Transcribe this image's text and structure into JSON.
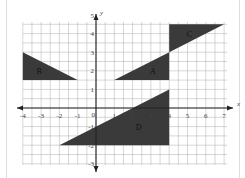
{
  "diagram": {
    "type": "coordinate-grid",
    "axes": {
      "x_label": "x",
      "y_label": "y",
      "origin_label": "0",
      "x_ticks": [
        "-4",
        "-3",
        "-2",
        "-1",
        "1",
        "2",
        "3",
        "4",
        "5",
        "6",
        "7"
      ],
      "y_ticks": [
        "5",
        "4",
        "3",
        "2",
        "1",
        "-1",
        "-2",
        "-3"
      ],
      "x_range": [
        -4.5,
        7.5
      ],
      "y_range": [
        -3,
        5
      ]
    },
    "shapes": [
      {
        "label": "A",
        "points": [
          [
            1,
            1.5
          ],
          [
            4,
            1.5
          ],
          [
            4,
            3
          ]
        ],
        "fill": "#3a3a3a"
      },
      {
        "label": "B",
        "points": [
          [
            -4,
            1.5
          ],
          [
            -4,
            3
          ],
          [
            -1,
            1.5
          ]
        ],
        "fill": "#3a3a3a"
      },
      {
        "label": "C",
        "points": [
          [
            4,
            3
          ],
          [
            4,
            4.5
          ],
          [
            7,
            4.5
          ]
        ],
        "fill": "#3a3a3a"
      },
      {
        "label": "D",
        "points": [
          [
            -2,
            -2
          ],
          [
            4,
            -2
          ],
          [
            4,
            1
          ]
        ],
        "fill": "#3a3a3a"
      }
    ],
    "colors": {
      "grid": "#bbbbbb",
      "axis": "#222222",
      "shape": "#3a3a3a",
      "text": "#444444"
    }
  }
}
